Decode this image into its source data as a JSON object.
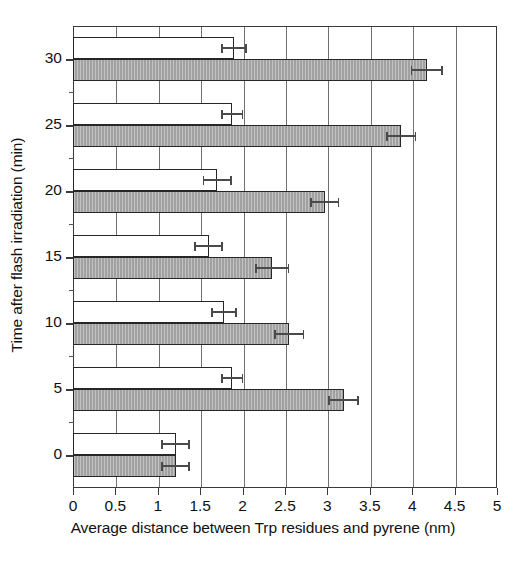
{
  "chart_data": {
    "type": "bar",
    "orientation": "horizontal",
    "title": "",
    "xlabel": "Average distance between Trp residues and pyrene (nm)",
    "ylabel": "Time after flash irradiation (min)",
    "xlim": [
      0,
      5
    ],
    "ylim": [
      -2.5,
      32.5
    ],
    "xticks": [
      0,
      0.5,
      1,
      1.5,
      2,
      2.5,
      3,
      3.5,
      4,
      4.5,
      5
    ],
    "xticklabels": [
      "0",
      "0.5",
      "1",
      "1.5",
      "2",
      "2.5",
      "3",
      "3.5",
      "4",
      "4.5",
      "5"
    ],
    "yticks": [
      0,
      5,
      10,
      15,
      20,
      25,
      30
    ],
    "yticklabels": [
      "0",
      "5",
      "10",
      "15",
      "20",
      "25",
      "30"
    ],
    "y_minor_ticks": [
      2.5,
      7.5,
      12.5,
      17.5,
      22.5,
      27.5
    ],
    "grid": "vertical",
    "legend": "none",
    "categories": [
      0,
      5,
      10,
      15,
      20,
      25,
      30
    ],
    "series": [
      {
        "name": "white-bar",
        "fill": "#ffffff",
        "values": [
          1.21,
          1.88,
          1.78,
          1.6,
          1.7,
          1.88,
          1.9
        ],
        "errors": [
          0.16,
          0.12,
          0.14,
          0.16,
          0.16,
          0.12,
          0.14
        ]
      },
      {
        "name": "gray-bar",
        "fill": "#a9a9a9",
        "values": [
          1.21,
          3.19,
          2.55,
          2.35,
          2.97,
          3.87,
          4.17
        ],
        "errors": [
          0.16,
          0.17,
          0.17,
          0.19,
          0.16,
          0.17,
          0.18
        ]
      }
    ]
  },
  "colors": {
    "axis": "#3a3a3a",
    "grid": "#707070",
    "bar_outline": "#262626",
    "white_fill": "#ffffff",
    "gray_fill": "#a9a9a9",
    "error": "#4a4a4a",
    "text": "#111111",
    "background": "#ffffff"
  }
}
